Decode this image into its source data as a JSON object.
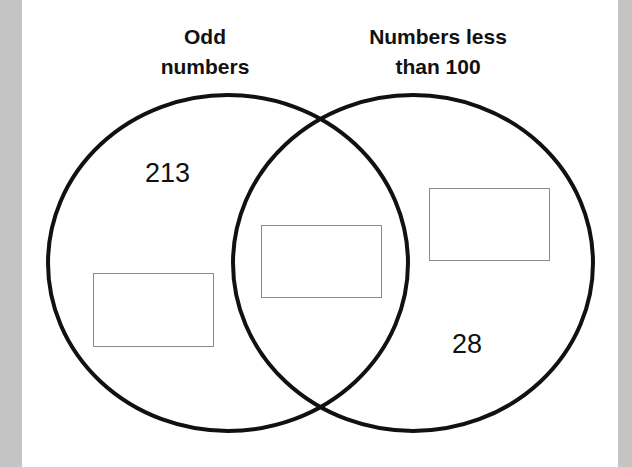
{
  "diagram": {
    "type": "venn",
    "sets": [
      {
        "id": "left",
        "label_lines": [
          "Odd",
          "numbers"
        ]
      },
      {
        "id": "right",
        "label_lines": [
          "Numbers less",
          "than 100"
        ]
      }
    ],
    "regions": {
      "left_only": {
        "number": "213",
        "answer_box": ""
      },
      "intersection": {
        "answer_box": ""
      },
      "right_only": {
        "number": "28",
        "answer_box": ""
      }
    },
    "colors": {
      "outline": "#111111",
      "box_border": "#8a8a8a",
      "side_bars": "#c4c4c4",
      "background": "#ffffff"
    }
  }
}
